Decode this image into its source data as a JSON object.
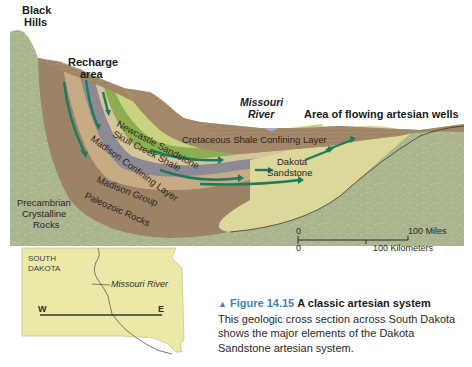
{
  "cross_section": {
    "labels": {
      "black_hills_line1": "Black",
      "black_hills_line2": "Hills",
      "recharge_line1": "Recharge",
      "recharge_line2": "area",
      "missouri_line1": "Missouri",
      "missouri_line2": "River",
      "flowing_wells": "Area of flowing artesian wells",
      "cretaceous": "Cretaceous Shale Confining Layer",
      "dakota_line1": "Dakota",
      "dakota_line2": "Sandstone",
      "newcastle": "Newcastle Sandstone",
      "skull_creek": "Skull Creek Shale",
      "madison_confining": "Madison Confining Layer",
      "madison_group": "Madison Group",
      "paleozoic": "Paleozoic Rocks",
      "precambrian_line1": "Precambrian",
      "precambrian_line2": "Crystalline",
      "precambrian_line3": "Rocks"
    },
    "colors": {
      "precambrian": "#a9b58f",
      "shale": "#a3896a",
      "dakota": "#dcd89a",
      "skull_creek": "#8cae4e",
      "madison_confining": "#8e8a94",
      "paleozoic": "#9c8366",
      "arrow": "#1e7a5e"
    },
    "scale_bar": {
      "miles_zero": "0",
      "miles_label": "100 Miles",
      "km_zero": "0",
      "km_label": "100 Kilometers"
    }
  },
  "inset_map": {
    "state_line1": "SOUTH",
    "state_line2": "DAKOTA",
    "river_label": "Missouri River",
    "west": "W",
    "east": "E",
    "fill": "#ece9a8"
  },
  "caption": {
    "marker": "▲",
    "figure_number": "Figure 14.15",
    "title": "A classic artesian system",
    "body": "This geologic cross section across South Dakota shows the major elements of the Dakota Sandstone artesian system."
  }
}
